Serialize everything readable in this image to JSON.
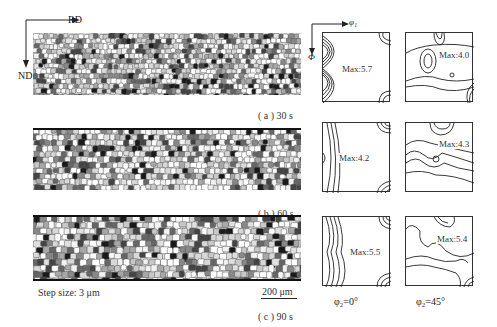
{
  "axes": {
    "rd": "RD",
    "nd": "ND",
    "phi1": "φ₁",
    "Phi": "Φ"
  },
  "panels": [
    {
      "id": "a",
      "caption": "( a ) 30 s"
    },
    {
      "id": "b",
      "caption": "( b ) 60 s"
    },
    {
      "id": "c",
      "caption": "( c ) 90 s"
    }
  ],
  "step_size": "Step size: 3 μm",
  "scale_bar": "200 μm",
  "odf": {
    "columns": [
      "φ₂=0°",
      "φ₂=45°"
    ],
    "rows": [
      {
        "phi2_0": "Max:5.7",
        "phi2_45": "Max:4.0"
      },
      {
        "phi2_0": "Max:4.2",
        "phi2_45": "Max:4.3"
      },
      {
        "phi2_0": "Max:5.5",
        "phi2_45": "Max:5.4"
      }
    ]
  }
}
